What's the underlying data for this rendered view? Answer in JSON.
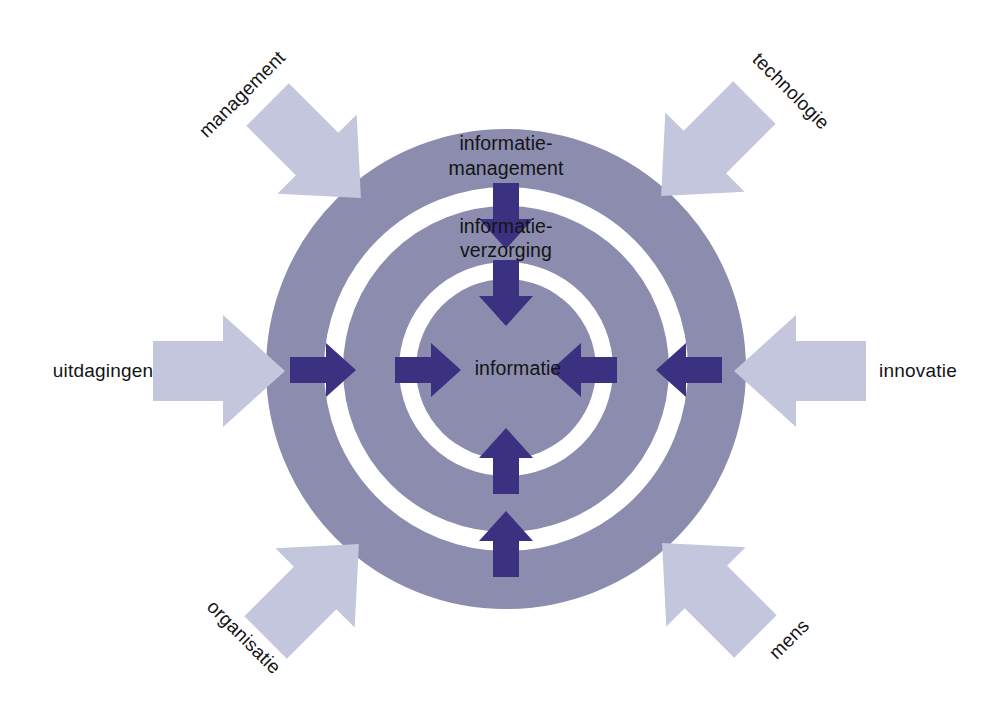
{
  "diagram": {
    "colors": {
      "ring_fill": "#8b8cae",
      "inner_arrow": "#3a3180",
      "driver_arrow": "#c3c6dc",
      "text": "#141414",
      "background": "#ffffff"
    },
    "rings": [
      {
        "id": "ring-outer",
        "label": "informatie-\nmanagement",
        "label_line_1": "informatie-",
        "label_line_2": "management",
        "outer_radius": 240,
        "inner_radius": 182
      },
      {
        "id": "ring-middle",
        "label_line_1": "informatie-",
        "label_line_2": "verzorging",
        "outer_radius": 163,
        "inner_radius": 107
      },
      {
        "id": "ring-core",
        "label_line_1": "informatie",
        "label_line_2": "",
        "outer_radius": 90,
        "inner_radius": 0
      }
    ],
    "center": {
      "x": 506,
      "y": 369
    },
    "inner_arrows": [
      {
        "id": "arrow-top-outer",
        "direction": "down",
        "from": "informatie-management",
        "to": "informatie-verzorging"
      },
      {
        "id": "arrow-top-inner",
        "direction": "down",
        "from": "informatie-verzorging",
        "to": "informatie"
      },
      {
        "id": "arrow-left-outer",
        "direction": "right",
        "from": "informatie-management",
        "to": "informatie-verzorging"
      },
      {
        "id": "arrow-left-inner",
        "direction": "right",
        "from": "informatie-verzorging",
        "to": "informatie"
      },
      {
        "id": "arrow-right-outer",
        "direction": "left",
        "from": "informatie-management",
        "to": "informatie-verzorging"
      },
      {
        "id": "arrow-right-inner",
        "direction": "left",
        "from": "informatie-verzorging",
        "to": "informatie"
      },
      {
        "id": "arrow-bottom-outer",
        "direction": "up",
        "from": "informatie-management",
        "to": "informatie-verzorging"
      },
      {
        "id": "arrow-bottom-inner",
        "direction": "up",
        "from": "informatie-verzorging",
        "to": "informatie"
      }
    ],
    "drivers": [
      {
        "id": "driver-management",
        "label": "management",
        "position": "top-left",
        "arrow_angle": 45,
        "label_rotation": -45,
        "label_x": 243,
        "label_y": 95,
        "arrow_cx": 310,
        "arrow_cy": 147
      },
      {
        "id": "driver-technologie",
        "label": "technologie",
        "position": "top-right",
        "arrow_angle": 135,
        "label_rotation": 45,
        "label_x": 790,
        "label_y": 92,
        "arrow_cx": 712,
        "arrow_cy": 145
      },
      {
        "id": "driver-uitdagingen",
        "label": "uitdagingen",
        "position": "left",
        "arrow_angle": 0,
        "label_rotation": 0,
        "label_x": 103,
        "label_y": 372,
        "arrow_cx": 213,
        "arrow_cy": 371
      },
      {
        "id": "driver-innovatie",
        "label": "innovatie",
        "position": "right",
        "arrow_angle": 180,
        "label_rotation": 0,
        "label_x": 918,
        "label_y": 372,
        "arrow_cx": 806,
        "arrow_cy": 371
      },
      {
        "id": "driver-organisatie",
        "label": "organisatie",
        "position": "bottom-left",
        "arrow_angle": -45,
        "label_rotation": 45,
        "label_x": 243,
        "label_y": 638,
        "arrow_cx": 308,
        "arrow_cy": 595
      },
      {
        "id": "driver-mens",
        "label": "mens",
        "position": "bottom-right",
        "arrow_angle": -135,
        "label_rotation": -45,
        "label_x": 790,
        "label_y": 640,
        "arrow_cx": 713,
        "arrow_cy": 594
      }
    ]
  }
}
